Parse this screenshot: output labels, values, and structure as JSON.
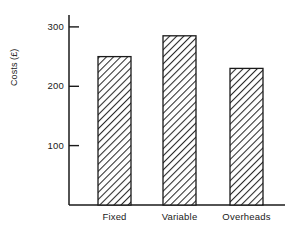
{
  "chart_data": {
    "type": "bar",
    "title": "",
    "subtitle": "",
    "xlabel": "",
    "ylabel": "Costs (£)",
    "categories": [
      "Fixed",
      "Variable",
      "Overheads"
    ],
    "values": [
      250,
      285,
      230
    ],
    "series": [
      {
        "name": "Costs",
        "values": [
          250,
          285,
          230
        ]
      }
    ],
    "ylim": [
      0,
      320
    ],
    "yticks": [
      100,
      200,
      300
    ],
    "ytick_labels": [
      "100",
      "200",
      "300"
    ],
    "grid": false,
    "legend": false,
    "legend_position": "none",
    "bar_fill": "diagonal-hatch",
    "bar_edge_color": "#1a1a1a",
    "bar_face_color": "#ffffff",
    "axis_color": "#1a1a1a",
    "background_color": "#ffffff",
    "annotations": []
  },
  "axes": {
    "y_label": "Costs (£)",
    "y_ticks": [
      {
        "value": "300"
      },
      {
        "value": "200"
      },
      {
        "value": "100"
      }
    ],
    "x_ticks": [
      {
        "label": "Fixed"
      },
      {
        "label": "Variable"
      },
      {
        "label": "Overheads"
      }
    ]
  },
  "bars": [
    {
      "category": "Fixed",
      "value": 250
    },
    {
      "category": "Variable",
      "value": 285
    },
    {
      "category": "Overheads",
      "value": 230
    }
  ]
}
